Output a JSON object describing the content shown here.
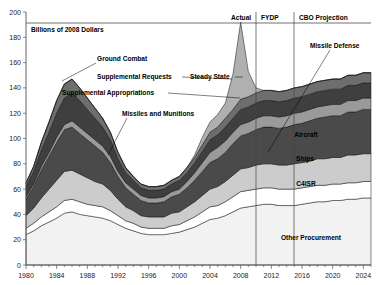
{
  "figure": {
    "unit_label": "Billions of 2008 Dollars",
    "top_sections": [
      {
        "name": "actual",
        "label": "Actual"
      },
      {
        "name": "fydp",
        "label": "FYDP"
      },
      {
        "name": "cbo",
        "label": "CBO Projection"
      }
    ]
  },
  "annotations": {
    "ground_combat": "Ground Combat",
    "supplemental_requests": "Supplemental Requests",
    "steady_state": "Steady State",
    "supplemental_appropriations": "Supplemental Appropriations",
    "missiles_and_munitions": "Missiles and Munitions",
    "missile_defense": "Missile Defense",
    "aircraft": "Aircraft",
    "ships": "Ships",
    "c4isr": "C4ISR",
    "other_procurement": "Other Procurement"
  },
  "colors": {
    "other_procurement": "#f2f2f2",
    "c4isr": "#ffffff",
    "ships_divider": "#3a3a3a",
    "ships": "#cccccc",
    "aircraft": "#4a4a4a",
    "missile_defense": "#9a9a9a",
    "missiles_munitions": "#3f3f3f",
    "ground_combat": "#6e6e6e",
    "supplemental": "#b0b0b0",
    "axis": "#555555",
    "text": "#000000"
  },
  "chart_data": {
    "type": "area",
    "stacked": true,
    "title": "",
    "subtitle": "",
    "xlabel": "",
    "ylabel": "Billions of 2008 Dollars",
    "xlim": [
      1980,
      2025
    ],
    "ylim": [
      0,
      200
    ],
    "ytick_step": 20,
    "xtick_step": 4,
    "grid": false,
    "legend_position": "in-plot annotations",
    "xticks": [
      1980,
      1984,
      1988,
      1992,
      1996,
      2000,
      2004,
      2008,
      2012,
      2016,
      2020,
      2024
    ],
    "yticks": [
      0,
      20,
      40,
      60,
      80,
      100,
      120,
      140,
      160,
      180,
      200
    ],
    "period_dividers": [
      2010,
      2015
    ],
    "period_labels": [
      "Actual",
      "FYDP",
      "CBO Projection"
    ],
    "x": [
      1980,
      1981,
      1982,
      1983,
      1984,
      1985,
      1986,
      1987,
      1988,
      1989,
      1990,
      1991,
      1992,
      1993,
      1994,
      1995,
      1996,
      1997,
      1998,
      1999,
      2000,
      2001,
      2002,
      2003,
      2004,
      2005,
      2006,
      2007,
      2008,
      2009,
      2010,
      2011,
      2012,
      2013,
      2014,
      2015,
      2016,
      2017,
      2018,
      2019,
      2020,
      2021,
      2022,
      2023,
      2024,
      2025
    ],
    "series": [
      {
        "name": "Other Procurement",
        "color": "#f2f2f2",
        "values": [
          24,
          27,
          31,
          34,
          37,
          41,
          42,
          40,
          39,
          38,
          37,
          35,
          32,
          29,
          27,
          25,
          24,
          24,
          24,
          25,
          26,
          28,
          30,
          33,
          36,
          37,
          39,
          42,
          45,
          46,
          47,
          48,
          48,
          47,
          47,
          47,
          48,
          49,
          50,
          50,
          51,
          51,
          52,
          52,
          53,
          53
        ]
      },
      {
        "name": "C4ISR",
        "color": "#ffffff",
        "values": [
          5,
          6,
          7,
          8,
          9,
          10,
          10,
          10,
          9,
          9,
          9,
          8,
          7,
          6,
          6,
          5,
          5,
          5,
          5,
          6,
          6,
          7,
          8,
          9,
          10,
          10,
          11,
          12,
          13,
          13,
          13,
          13,
          13,
          13,
          13,
          13,
          13,
          13,
          13,
          13,
          13,
          13,
          13,
          13,
          13,
          13
        ]
      },
      {
        "name": "Ships",
        "color": "#cccccc",
        "values": [
          10,
          12,
          15,
          18,
          21,
          23,
          23,
          22,
          21,
          19,
          18,
          16,
          13,
          11,
          10,
          9,
          9,
          9,
          9,
          10,
          10,
          11,
          12,
          13,
          14,
          15,
          16,
          17,
          18,
          18,
          19,
          19,
          19,
          19,
          19,
          20,
          20,
          20,
          21,
          21,
          21,
          21,
          22,
          22,
          22,
          22
        ]
      },
      {
        "name": "Aircraft",
        "color": "#4a4a4a",
        "values": [
          13,
          17,
          22,
          26,
          30,
          33,
          34,
          32,
          30,
          28,
          25,
          22,
          18,
          15,
          13,
          12,
          11,
          11,
          12,
          13,
          14,
          15,
          17,
          19,
          21,
          22,
          23,
          25,
          26,
          27,
          28,
          29,
          29,
          29,
          30,
          31,
          31,
          32,
          32,
          33,
          33,
          33,
          34,
          34,
          35,
          35
        ]
      },
      {
        "name": "Missile Defense",
        "color": "#9a9a9a",
        "values": [
          2,
          2,
          3,
          3,
          4,
          4,
          5,
          5,
          5,
          5,
          5,
          5,
          4,
          4,
          4,
          4,
          4,
          4,
          4,
          4,
          4,
          5,
          6,
          7,
          8,
          9,
          9,
          9,
          9,
          9,
          9,
          9,
          9,
          9,
          9,
          9,
          9,
          9,
          9,
          9,
          9,
          9,
          9,
          9,
          9,
          9
        ]
      },
      {
        "name": "Missiles and Munitions",
        "color": "#3f3f3f",
        "values": [
          8,
          10,
          13,
          16,
          19,
          21,
          22,
          21,
          19,
          17,
          15,
          13,
          10,
          8,
          7,
          6,
          6,
          6,
          6,
          6,
          7,
          7,
          8,
          9,
          10,
          10,
          11,
          11,
          12,
          12,
          12,
          12,
          12,
          12,
          12,
          12,
          12,
          12,
          12,
          12,
          12,
          12,
          12,
          12,
          12,
          12
        ]
      },
      {
        "name": "Ground Combat",
        "color": "#6e6e6e",
        "values": [
          3,
          4,
          6,
          8,
          10,
          11,
          11,
          10,
          9,
          8,
          7,
          6,
          5,
          4,
          3,
          3,
          3,
          3,
          3,
          3,
          3,
          4,
          4,
          5,
          6,
          6,
          7,
          7,
          8,
          8,
          8,
          8,
          8,
          8,
          8,
          8,
          8,
          8,
          8,
          8,
          8,
          8,
          8,
          8,
          8,
          8
        ]
      },
      {
        "name": "Supplemental Appropriations / Requests",
        "color": "#b0b0b0",
        "values": [
          0,
          0,
          0,
          0,
          0,
          0,
          0,
          0,
          0,
          0,
          0,
          0,
          0,
          0,
          0,
          0,
          0,
          0,
          0,
          0,
          0,
          0,
          2,
          6,
          8,
          10,
          12,
          28,
          61,
          20,
          4,
          0,
          0,
          0,
          0,
          0,
          0,
          0,
          0,
          0,
          0,
          0,
          0,
          0,
          0,
          0
        ]
      }
    ],
    "notes": {
      "peak_1985_total": 145,
      "peak_2008_total": 170,
      "trough_1997_total": 64
    }
  }
}
